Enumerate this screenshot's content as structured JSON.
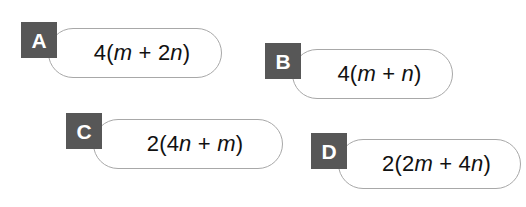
{
  "question": {
    "options": [
      {
        "letter": "A",
        "text": "4(m + 2n)",
        "parts": [
          {
            "t": "4(",
            "italic": false
          },
          {
            "t": "m",
            "italic": true
          },
          {
            "t": " + 2",
            "italic": false
          },
          {
            "t": "n",
            "italic": true
          },
          {
            "t": ")",
            "italic": false
          }
        ]
      },
      {
        "letter": "B",
        "text": "4(m + n)",
        "parts": [
          {
            "t": "4(",
            "italic": false
          },
          {
            "t": "m",
            "italic": true
          },
          {
            "t": " + ",
            "italic": false
          },
          {
            "t": "n",
            "italic": true
          },
          {
            "t": ")",
            "italic": false
          }
        ]
      },
      {
        "letter": "C",
        "text": "2(4n + m)",
        "parts": [
          {
            "t": "2(4",
            "italic": false
          },
          {
            "t": "n",
            "italic": true
          },
          {
            "t": " + ",
            "italic": false
          },
          {
            "t": "m",
            "italic": true
          },
          {
            "t": ")",
            "italic": false
          }
        ]
      },
      {
        "letter": "D",
        "text": "2(2m + 4n)",
        "parts": [
          {
            "t": "2(2",
            "italic": false
          },
          {
            "t": "m",
            "italic": true
          },
          {
            "t": " + 4",
            "italic": false
          },
          {
            "t": "n",
            "italic": true
          },
          {
            "t": ")",
            "italic": false
          }
        ]
      }
    ]
  },
  "colors": {
    "background": "#ffffff",
    "badge_fill": "#575757",
    "badge_text": "#ffffff",
    "pill_fill": "#ffffff",
    "pill_border": "#a8a8a8",
    "option_text": "#111111"
  }
}
